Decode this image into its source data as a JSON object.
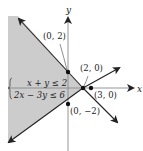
{
  "diagram": {
    "type": "linear-inequality-system-graph",
    "axes": {
      "x_label": "x",
      "y_label": "y"
    },
    "system": {
      "inequality_1": "x + y ≤ 2",
      "inequality_2": "2x − 3y ≤ 6"
    },
    "points": [
      {
        "label": "(0, 2)"
      },
      {
        "label": "(2, 0)"
      },
      {
        "label": "(3, 0)"
      },
      {
        "label": "(0, −2)"
      }
    ],
    "colors": {
      "shade": "#cccccc",
      "line": "#222222"
    }
  }
}
